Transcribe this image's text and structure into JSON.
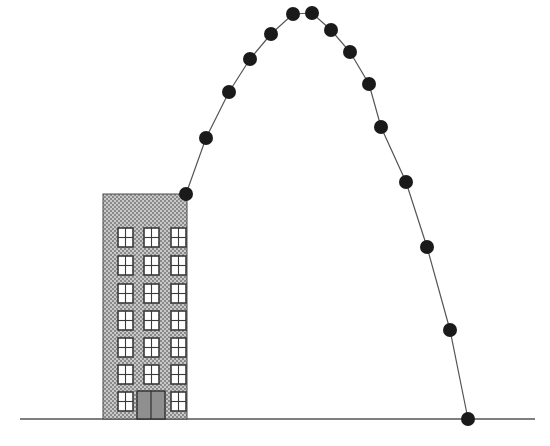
{
  "figure": {
    "type": "physics-trajectory-diagram",
    "width": 550,
    "height": 446,
    "background_color": "#ffffff"
  },
  "ground": {
    "label": "ground-line",
    "x_start": 20,
    "x_end": 535,
    "y": 419,
    "color": "#555555",
    "stroke_width": 1.3
  },
  "building": {
    "label": "building",
    "x": 103,
    "y": 194,
    "width": 84,
    "height": 225,
    "fill_color": "#b3b3b3",
    "texture": "stipple-dots",
    "outline_color": "#4a4a4a",
    "floors": 7,
    "window_columns": 3,
    "window_rows": 7,
    "window": {
      "width": 15,
      "height": 19,
      "fill_color": "#ffffff",
      "frame_color": "#3a3a3a",
      "panes": 4,
      "column_x": [
        118,
        144,
        171
      ],
      "row_y": [
        228,
        256,
        284,
        311,
        338,
        365,
        392
      ]
    },
    "door": {
      "label": "double-door",
      "x": 137,
      "y": 391,
      "width": 28,
      "height": 28,
      "fill_color": "#8f8f8f",
      "frame_color": "#2f2f2f",
      "leaves": 2
    }
  },
  "trajectory": {
    "label": "projectile-path",
    "path_color": "#555555",
    "path_stroke_width": 1.2,
    "ball_color": "#1a1a1a",
    "ball_radius": 7,
    "ball_count": 16,
    "launch_point_index": 0,
    "apex_indices": [
      5,
      6
    ],
    "landing_index": 15,
    "points": [
      {
        "n": 1,
        "x": 186,
        "y": 194
      },
      {
        "n": 2,
        "x": 206,
        "y": 138
      },
      {
        "n": 3,
        "x": 229,
        "y": 92
      },
      {
        "n": 4,
        "x": 250,
        "y": 59
      },
      {
        "n": 5,
        "x": 271,
        "y": 34
      },
      {
        "n": 6,
        "x": 293,
        "y": 14
      },
      {
        "n": 7,
        "x": 312,
        "y": 13
      },
      {
        "n": 8,
        "x": 331,
        "y": 30
      },
      {
        "n": 9,
        "x": 350,
        "y": 52
      },
      {
        "n": 10,
        "x": 369,
        "y": 84
      },
      {
        "n": 11,
        "x": 381,
        "y": 127
      },
      {
        "n": 12,
        "x": 406,
        "y": 182
      },
      {
        "n": 13,
        "x": 427,
        "y": 247
      },
      {
        "n": 14,
        "x": 450,
        "y": 330
      },
      {
        "n": 15,
        "x": 468,
        "y": 419
      }
    ]
  },
  "chart_data": {
    "type": "scatter",
    "xlabel": "",
    "ylabel": "",
    "xlim": [
      0,
      550
    ],
    "ylim": [
      0,
      446
    ],
    "grid": false,
    "legend": "none",
    "series": [
      {
        "name": "projectile positions",
        "x": [
          186,
          206,
          229,
          250,
          271,
          293,
          312,
          331,
          350,
          369,
          381,
          406,
          427,
          450,
          468
        ],
        "y": [
          194,
          138,
          92,
          59,
          34,
          14,
          13,
          30,
          52,
          84,
          127,
          182,
          247,
          330,
          419
        ]
      }
    ],
    "annotations": [
      {
        "text": "launch point at rooftop edge",
        "x": 186,
        "y": 194
      },
      {
        "text": "apex of trajectory",
        "x": 302,
        "y": 13
      },
      {
        "text": "landing point on ground",
        "x": 468,
        "y": 419
      }
    ]
  }
}
